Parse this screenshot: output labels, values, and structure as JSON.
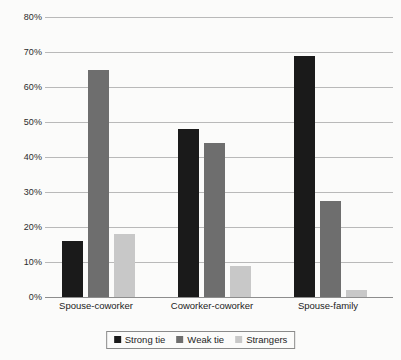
{
  "chart_data": {
    "type": "bar",
    "title": "",
    "subtitle": "",
    "xlabel": "",
    "ylabel": "",
    "ylim": [
      0,
      80
    ],
    "ytick_step": 10,
    "ytick_labels": [
      "0%",
      "10%",
      "20%",
      "30%",
      "40%",
      "50%",
      "60%",
      "70%",
      "80%"
    ],
    "ytick_values": [
      0,
      10,
      20,
      30,
      40,
      50,
      60,
      70,
      80
    ],
    "grid": "horizontal",
    "legend_position": "bottom-center",
    "value_suffix": "%",
    "categories": [
      "Spouse-coworker",
      "Coworker-coworker",
      "Spouse-family"
    ],
    "series": [
      {
        "name": "Strong tie",
        "color": "#1a1a1a",
        "values": [
          16,
          48,
          69
        ]
      },
      {
        "name": "Weak tie",
        "color": "#6e6e6e",
        "values": [
          65,
          44,
          27.5
        ]
      },
      {
        "name": "Strangers",
        "color": "#c8c8c8",
        "values": [
          18,
          9,
          2
        ]
      }
    ]
  },
  "legend": {
    "items": [
      {
        "label": "Strong tie",
        "swatch_name": "legend-swatch-strong-tie"
      },
      {
        "label": "Weak tie",
        "swatch_name": "legend-swatch-weak-tie"
      },
      {
        "label": "Strangers",
        "swatch_name": "legend-swatch-strangers"
      }
    ]
  }
}
